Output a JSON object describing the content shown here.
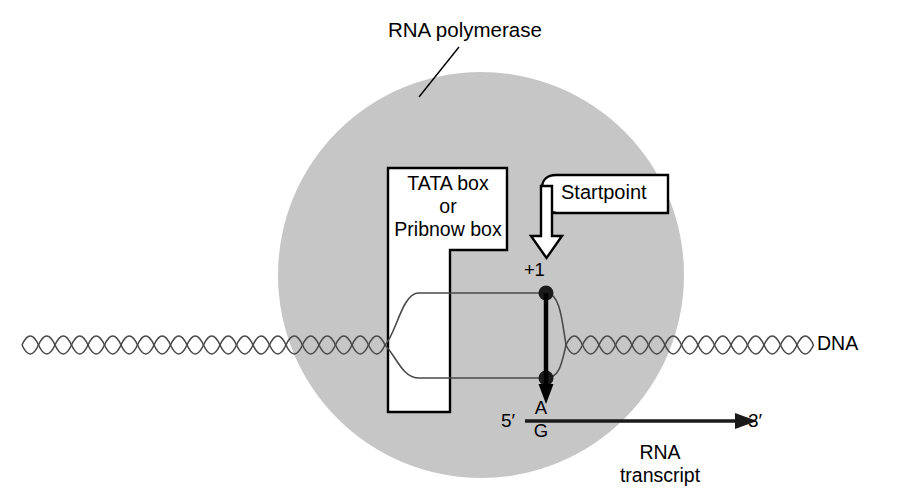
{
  "figure": {
    "width": 904,
    "height": 501,
    "background": "#ffffff"
  },
  "colors": {
    "polymerase_fill": "#c6c6c6",
    "line": "#000000",
    "dna_strand": "#444444",
    "callout_fill": "#ffffff",
    "text": "#000000"
  },
  "labels": {
    "rna_polymerase": "RNA polymerase",
    "promoter_box": {
      "line1": "TATA box",
      "line2": "or",
      "line3": "Pribnow box"
    },
    "startpoint": "Startpoint",
    "plus_one": "+1",
    "dna": "DNA",
    "five_prime": "5′",
    "three_prime": "3′",
    "initiating_base": {
      "purine_a": "A",
      "purine_g": "G"
    },
    "rna_transcript": {
      "line1": "RNA",
      "line2": "transcript"
    }
  },
  "geometry": {
    "polymerase_circle": {
      "cx": 481,
      "cy": 275,
      "r": 203
    },
    "dna_axis_y": 345,
    "helix_period": 22,
    "helix_amplitude": 12,
    "bubble_top_y": 293,
    "bubble_bottom_y": 378,
    "startpoint_x": 546,
    "transcript_y": 421
  }
}
